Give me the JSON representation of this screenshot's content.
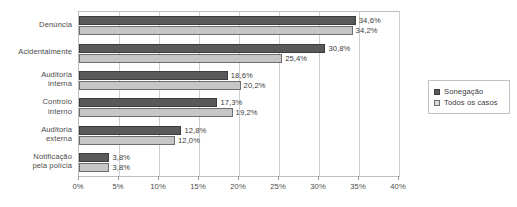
{
  "chart_data": {
    "type": "bar",
    "orientation": "horizontal",
    "title": "",
    "xlabel": "",
    "ylabel": "",
    "xlim": [
      0,
      40
    ],
    "xtick_labels": [
      "0%",
      "5%",
      "10%",
      "15%",
      "20%",
      "25%",
      "30%",
      "35%",
      "40%"
    ],
    "xticks": [
      0,
      5,
      10,
      15,
      20,
      25,
      30,
      35,
      40
    ],
    "grid": true,
    "legend_position": "right",
    "categories": [
      "Denúncia",
      "Acidentalmente",
      "Auditoria interna",
      "Controlo interno",
      "Auditoria externa",
      "Notificação pela polícia"
    ],
    "category_lines": [
      [
        "Denúncia"
      ],
      [
        "Acidentalmente"
      ],
      [
        "Auditoria",
        "interna"
      ],
      [
        "Controlo",
        "interno"
      ],
      [
        "Auditoria",
        "externa"
      ],
      [
        "Notificação",
        "pela polícia"
      ]
    ],
    "series": [
      {
        "name": "Sonegação",
        "color": "#595959",
        "values": [
          34.6,
          30.8,
          18.6,
          17.3,
          12.8,
          3.8
        ],
        "labels": [
          "34,6%",
          "30,8%",
          "18,6%",
          "17,3%",
          "12,8%",
          "3,8%"
        ]
      },
      {
        "name": "Todos os casos",
        "color": "#c6c6c6",
        "values": [
          34.2,
          25.4,
          20.2,
          19.2,
          12.0,
          3.8
        ],
        "labels": [
          "34,2%",
          "25,4%",
          "20,2%",
          "19,2%",
          "12,0%",
          "3,8%"
        ]
      }
    ]
  },
  "legend": {
    "entries": [
      {
        "label": "Sonegação"
      },
      {
        "label": "Todos os casos"
      }
    ]
  }
}
